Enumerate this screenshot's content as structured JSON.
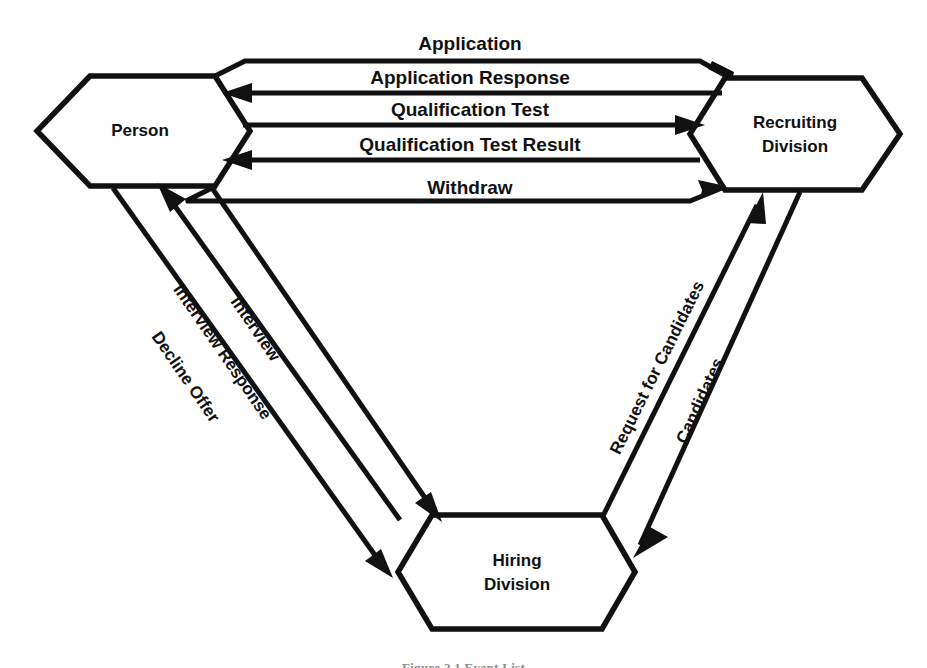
{
  "figure": {
    "caption": "Figure 2.1  Event List",
    "background_color": "#ffffff",
    "line_color": "#111111"
  },
  "nodes": [
    {
      "id": "person",
      "label_line1": "Person",
      "label_line2": "",
      "shape": "hexagon"
    },
    {
      "id": "recruiting-division",
      "label_line1": "Recruiting",
      "label_line2": "Division",
      "shape": "hexagon"
    },
    {
      "id": "hiring-division",
      "label_line1": "Hiring",
      "label_line2": "Division",
      "shape": "hexagon"
    }
  ],
  "edges": [
    {
      "id": "application",
      "label": "Application",
      "from": "person",
      "to": "recruiting-division",
      "orientation": "horizontal"
    },
    {
      "id": "application-response",
      "label": "Application Response",
      "from": "recruiting-division",
      "to": "person",
      "orientation": "horizontal"
    },
    {
      "id": "qualification-test",
      "label": "Qualification Test",
      "from": "person",
      "to": "recruiting-division",
      "orientation": "horizontal"
    },
    {
      "id": "qualification-test-result",
      "label": "Qualification Test Result",
      "from": "recruiting-division",
      "to": "person",
      "orientation": "horizontal"
    },
    {
      "id": "withdraw",
      "label": "Withdraw",
      "from": "person",
      "to": "recruiting-division",
      "orientation": "horizontal"
    },
    {
      "id": "interview",
      "label": "Interview",
      "from": "person",
      "to": "hiring-division",
      "orientation": "diagonal-left"
    },
    {
      "id": "interview-response",
      "label": "Interview Response",
      "from": "hiring-division",
      "to": "person",
      "orientation": "diagonal-left"
    },
    {
      "id": "decline-offer",
      "label": "Decline Offer",
      "from": "person",
      "to": "hiring-division",
      "orientation": "diagonal-left"
    },
    {
      "id": "request-for-candidates",
      "label": "Request for Candidates",
      "from": "hiring-division",
      "to": "recruiting-division",
      "orientation": "diagonal-right"
    },
    {
      "id": "candidates",
      "label": "Candidates",
      "from": "recruiting-division",
      "to": "hiring-division",
      "orientation": "diagonal-right"
    }
  ]
}
